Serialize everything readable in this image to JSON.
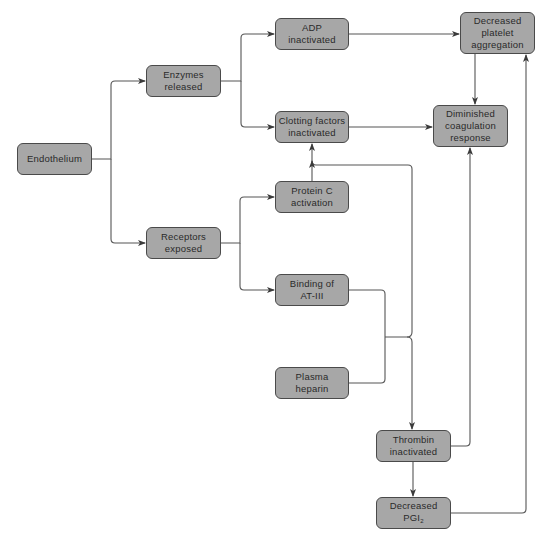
{
  "diagram": {
    "type": "flowchart",
    "nodes": {
      "endothelium": {
        "lines": [
          "Endothelium"
        ]
      },
      "enzymes": {
        "lines": [
          "Enzymes",
          "released"
        ]
      },
      "receptors": {
        "lines": [
          "Receptors",
          "exposed"
        ]
      },
      "adp": {
        "lines": [
          "ADP",
          "inactivated"
        ]
      },
      "clotting": {
        "lines": [
          "Clotting factors",
          "inactivated"
        ]
      },
      "proteinc": {
        "lines": [
          "Protein C",
          "activation"
        ]
      },
      "binding": {
        "lines": [
          "Binding of",
          "AT-III"
        ]
      },
      "heparin": {
        "lines": [
          "Plasma",
          "heparin"
        ]
      },
      "platelet": {
        "lines": [
          "Decreased",
          "platelet",
          "aggregation"
        ]
      },
      "coagulation": {
        "lines": [
          "Diminished",
          "coagulation",
          "response"
        ]
      },
      "thrombin": {
        "lines": [
          "Thrombin",
          "inactivated"
        ]
      },
      "pgi2": {
        "lines": [
          "Decreased",
          "PGI"
        ],
        "subscript": "2"
      }
    },
    "edges": [
      {
        "from": "Endothelium",
        "to": "Enzymes released"
      },
      {
        "from": "Endothelium",
        "to": "Receptors exposed"
      },
      {
        "from": "Enzymes released",
        "to": "ADP inactivated"
      },
      {
        "from": "Enzymes released",
        "to": "Clotting factors inactivated"
      },
      {
        "from": "Receptors exposed",
        "to": "Protein C activation"
      },
      {
        "from": "Receptors exposed",
        "to": "Binding of AT-III"
      },
      {
        "from": "Protein C activation",
        "to": "Clotting factors inactivated"
      },
      {
        "from": "Binding of AT-III + Plasma heparin",
        "to": "Clotting factors inactivated"
      },
      {
        "from": "Binding of AT-III + Plasma heparin",
        "to": "Thrombin inactivated"
      },
      {
        "from": "ADP inactivated",
        "to": "Decreased platelet aggregation"
      },
      {
        "from": "Clotting factors inactivated",
        "to": "Diminished coagulation response"
      },
      {
        "from": "Decreased platelet aggregation",
        "to": "Diminished coagulation response"
      },
      {
        "from": "Thrombin inactivated",
        "to": "Diminished coagulation response"
      },
      {
        "from": "Thrombin inactivated",
        "to": "Decreased PGI2"
      },
      {
        "from": "Decreased PGI2",
        "to": "Decreased platelet aggregation"
      }
    ]
  }
}
